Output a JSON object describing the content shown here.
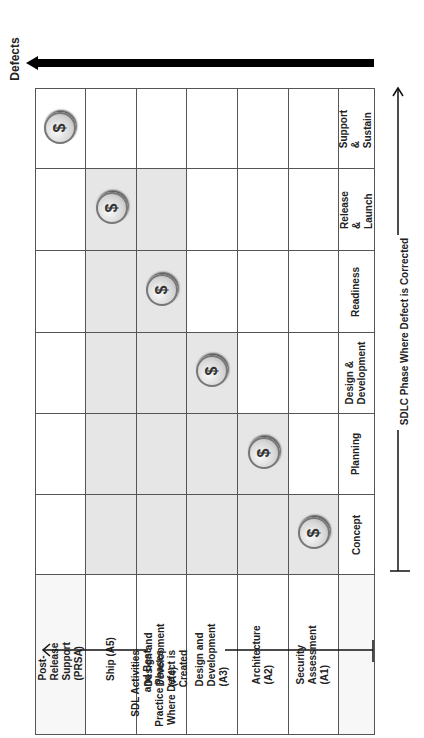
{
  "diagram": {
    "defects_label": "Defects",
    "y_axis_label": "SDL Activities and Best Practice Phases Where Defect is Created",
    "x_axis_label": "SDLC Phase Where Defect is Corrected",
    "coin_symbol": "$",
    "created_phases": [
      "Post-Release Support (PRSA)",
      "Ship (A5)",
      "Design and Development (A4)",
      "Design and Development (A3)",
      "Architecture (A2)",
      "Security Assessment (A1)"
    ],
    "corrected_phases": [
      "Concept",
      "Planning",
      "Design & Development",
      "Readiness",
      "Release & Launch",
      "Support & Sustain"
    ],
    "colors": {
      "shaded_cell": "#e6e6e6",
      "border": "#555555",
      "arrow": "#000000"
    }
  }
}
